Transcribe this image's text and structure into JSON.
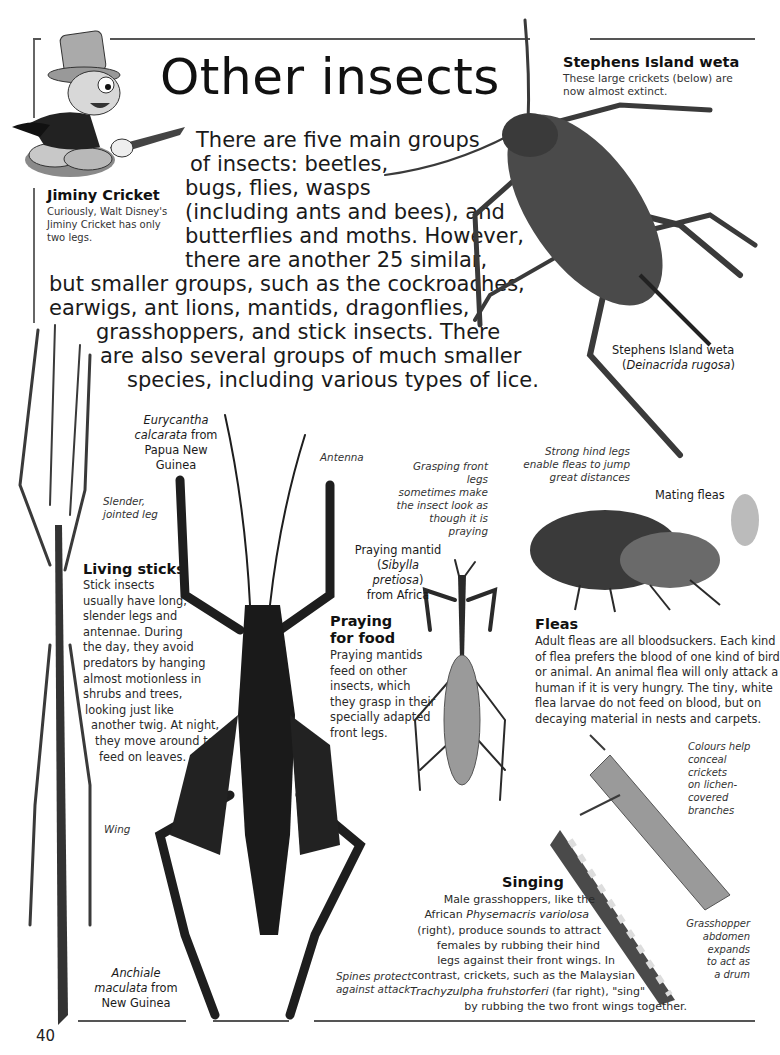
{
  "page": {
    "title": "Other insects",
    "page_number": "40"
  },
  "intro": {
    "lines": [
      "There are five main groups",
      "of insects: beetles,",
      "bugs, flies, wasps",
      "(including ants and bees), and",
      "butterflies and moths. However,",
      "there are another 25 similar,",
      "but smaller groups, such as the cockroaches,",
      "earwigs, ant lions, mantids, dragonflies,",
      "grasshoppers, and stick insects. There",
      "are also several groups of much smaller",
      "species, including various types of lice."
    ]
  },
  "jiminy": {
    "heading": "Jiminy Cricket",
    "lines": [
      "Curiously, Walt Disney's",
      "Jiminy Cricket has only",
      "two legs."
    ]
  },
  "weta": {
    "heading": "Stephens Island weta",
    "lines": [
      "These large crickets (below) are",
      "now almost extinct."
    ],
    "label_name": "Stephens Island weta",
    "label_latin": "Deinacrida rugosa"
  },
  "living_sticks": {
    "heading": "Living sticks",
    "lines": [
      "Stick insects",
      "usually have long,",
      "slender legs and",
      "antennae. During",
      "the day, they avoid",
      "predators by hanging",
      "almost motionless in",
      "shrubs and trees,",
      "looking just like",
      "another twig. At night,",
      "they move around to",
      "feed on leaves."
    ],
    "note_leg": [
      "Slender,",
      "jointed leg"
    ],
    "note_wing": "Wing",
    "species_latin": "Anchiale",
    "species_latin2": "maculata",
    "species_rest": " from",
    "species_place": "New Guinea"
  },
  "eurycantha": {
    "latin1": "Eurycantha",
    "latin2": "calcarata",
    "from": " from",
    "place1": "Papua New",
    "place2": "Guinea",
    "note_antenna": "Antenna",
    "note_spines": [
      "Spines protect",
      "against attack"
    ]
  },
  "mantid": {
    "heading1": "Praying",
    "heading2": "for food",
    "lines": [
      "Praying mantids",
      "feed on other",
      "insects, which",
      "they grasp in their",
      "specially adapted",
      "front legs."
    ],
    "label_name": "Praying mantid",
    "label_latin": "Sibylla pretiosa",
    "label_from": "from Africa",
    "note": [
      "Grasping front legs",
      "sometimes make",
      "the insect look as",
      "though it is praying"
    ]
  },
  "fleas": {
    "heading": "Fleas",
    "lines": [
      "Adult fleas are all bloodsuckers. Each kind",
      "of flea prefers the blood of one kind of bird",
      "or animal. An animal flea will only attack a",
      "human if it is very hungry. The tiny, white",
      "flea larvae do not feed on blood, but on",
      "decaying material in nests and carpets."
    ],
    "note": [
      "Strong hind legs",
      "enable fleas to jump",
      "great distances"
    ],
    "label": "Mating fleas"
  },
  "singing": {
    "heading": "Singing",
    "line1": "Male grasshoppers, like the",
    "line2_a": "African ",
    "line2_i": "Physemacris variolosa",
    "line3": "(right), produce sounds to attract",
    "line4": "females by rubbing their hind",
    "line5": "legs against their front wings. In",
    "line6": "contrast, crickets, such as the Malaysian",
    "line7_i": "Trachyzulpha fruhstorferi",
    "line7_b": " (far right), \"sing\"",
    "line8": "by rubbing the two front wings together.",
    "note_colours": [
      "Colours help",
      "conceal crickets",
      "on lichen-",
      "covered",
      "branches"
    ],
    "note_abdomen": [
      "Grasshopper",
      "abdomen",
      "expands",
      "to act as",
      "a drum"
    ]
  }
}
